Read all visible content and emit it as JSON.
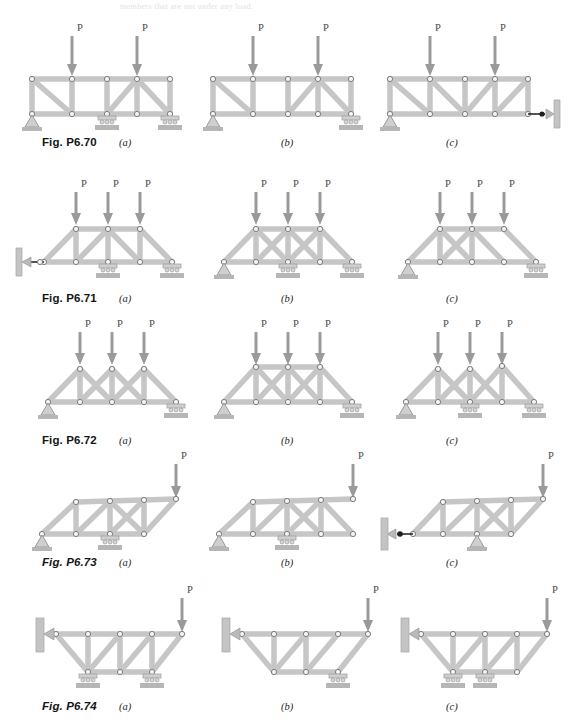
{
  "page": {
    "ghost_text": "members that are not under any load.",
    "load_label": "P",
    "member_color": "#c3c3c3",
    "member_edge": "#8e8e8e",
    "joint_fill": "#f2f2f2",
    "joint_stroke": "#7a7a7a",
    "arrow_color": "#9a9a9a",
    "ground_color": "#b8b8b8",
    "support_color": "#cfcfcf"
  },
  "figures": [
    {
      "id": "p6-70",
      "label": "Fig. P6.70",
      "label_italic": false,
      "label_x": 42,
      "label_y": 136,
      "y": 24,
      "panels": [
        {
          "letter": "(a)",
          "letter_x": 119,
          "letter_y": 136,
          "x": 24,
          "type": "parallel-chord",
          "description": "Parallel chord truss, 4 panels, pin at left, rollers at mid and right",
          "loads": [
            1,
            3
          ],
          "supports": [
            {
              "node": 0,
              "kind": "pin"
            },
            {
              "node": 2,
              "kind": "roller"
            },
            {
              "node": 4,
              "kind": "roller"
            }
          ],
          "diagonals": [
            "d1-down",
            "d3-down",
            "d4-down"
          ],
          "verticals": [
            1,
            2,
            3
          ]
        },
        {
          "letter": "(b)",
          "letter_x": 281,
          "letter_y": 136,
          "x": 205,
          "type": "parallel-chord",
          "description": "Parallel chord truss, 4 panels, pin at left, roller at right",
          "loads": [
            1,
            3
          ],
          "supports": [
            {
              "node": 0,
              "kind": "pin"
            },
            {
              "node": 4,
              "kind": "roller"
            }
          ],
          "diagonals": [
            "d1-down",
            "d3-down",
            "d4-down"
          ],
          "verticals": [
            1,
            2,
            3
          ]
        },
        {
          "letter": "(c)",
          "letter_x": 446,
          "letter_y": 136,
          "x": 382,
          "type": "parallel-chord",
          "description": "Parallel chord truss, pin at left, horizontal link to wall at right",
          "loads": [
            1,
            3
          ],
          "supports": [
            {
              "node": 0,
              "kind": "pin"
            },
            {
              "node": 4,
              "kind": "link-right"
            }
          ],
          "diagonals": [
            "d1-down",
            "d2-down",
            "d3-up",
            "d4-up"
          ],
          "verticals": [
            1,
            2,
            3
          ]
        }
      ]
    },
    {
      "id": "p6-71",
      "label": "Fig. P6.71",
      "label_italic": false,
      "label_x": 42,
      "label_y": 292,
      "y": 186,
      "panels": [
        {
          "letter": "(a)",
          "letter_x": 119,
          "letter_y": 292,
          "x": 18,
          "type": "trapezoid",
          "description": "Trapezoidal truss, wall link at left, rollers under mid and right",
          "loads": [
            1,
            2,
            3
          ],
          "supports": [
            {
              "node": 0,
              "kind": "link-left"
            },
            {
              "node": 2,
              "kind": "roller"
            },
            {
              "node": 4,
              "kind": "roller"
            }
          ],
          "bracing": "single"
        },
        {
          "letter": "(b)",
          "letter_x": 281,
          "letter_y": 292,
          "x": 198,
          "type": "trapezoid",
          "description": "Trapezoidal truss with X-bracing in both middle panels",
          "loads": [
            1,
            2,
            3
          ],
          "supports": [
            {
              "node": 0,
              "kind": "pin"
            },
            {
              "node": 2,
              "kind": "roller"
            },
            {
              "node": 4,
              "kind": "roller"
            }
          ],
          "bracing": "double-x"
        },
        {
          "letter": "(c)",
          "letter_x": 446,
          "letter_y": 292,
          "x": 382,
          "type": "trapezoid",
          "description": "Trapezoidal truss with X-bracing in left middle panel only",
          "loads": [
            1,
            2,
            3
          ],
          "supports": [
            {
              "node": 0,
              "kind": "pin"
            },
            {
              "node": 4,
              "kind": "roller"
            }
          ],
          "bracing": "single-x"
        }
      ]
    },
    {
      "id": "p6-72",
      "label": "Fig. P6.72",
      "label_italic": false,
      "label_x": 42,
      "label_y": 434,
      "y": 326,
      "panels": [
        {
          "letter": "(a)",
          "letter_x": 119,
          "letter_y": 434,
          "x": 24,
          "type": "w-truss",
          "description": "W pattern roof truss with three apexes, pin left, roller right",
          "loads": [
            1,
            2,
            3
          ],
          "supports": [
            {
              "node": 0,
              "kind": "pin"
            },
            {
              "node": 4,
              "kind": "roller"
            }
          ]
        },
        {
          "letter": "(b)",
          "letter_x": 281,
          "letter_y": 434,
          "x": 198,
          "type": "w-truss-flat",
          "description": "Flat-top W truss with X-bracing, pin left, roller right",
          "loads": [
            1,
            2,
            3
          ],
          "supports": [
            {
              "node": 0,
              "kind": "pin"
            },
            {
              "node": 4,
              "kind": "roller"
            }
          ]
        },
        {
          "letter": "(c)",
          "letter_x": 446,
          "letter_y": 434,
          "x": 382,
          "type": "w-truss",
          "description": "W pattern roof truss, pin left, rollers at middle and right",
          "loads": [
            1,
            2,
            3
          ],
          "supports": [
            {
              "node": 0,
              "kind": "pin"
            },
            {
              "node": 2,
              "kind": "roller"
            },
            {
              "node": 4,
              "kind": "roller"
            }
          ]
        }
      ]
    },
    {
      "id": "p6-73",
      "label": "Fig. P6.73",
      "label_italic": true,
      "label_x": 42,
      "label_y": 556,
      "y": 462,
      "panels": [
        {
          "letter": "(a)",
          "letter_x": 119,
          "letter_y": 556,
          "x": 28,
          "type": "cantilever-right",
          "description": "Cantilever truss with sloped ends, load P at right tip, pin left, roller mid",
          "loads": [
            "tip"
          ],
          "supports": [
            {
              "node": 0,
              "kind": "pin"
            },
            {
              "node": 2,
              "kind": "roller"
            }
          ],
          "bracing": "x-middle"
        },
        {
          "letter": "(b)",
          "letter_x": 281,
          "letter_y": 556,
          "x": 205,
          "type": "cantilever-right",
          "description": "Cantilever truss, flat right end, pin left, roller mid",
          "loads": [
            "tip"
          ],
          "supports": [
            {
              "node": 0,
              "kind": "pin"
            },
            {
              "node": 2,
              "kind": "roller"
            }
          ],
          "bracing": "x-middle"
        },
        {
          "letter": "(c)",
          "letter_x": 446,
          "letter_y": 556,
          "x": 375,
          "type": "cantilever-right",
          "description": "Cantilever truss, wall link at left, pin support at middle",
          "loads": [
            "tip"
          ],
          "supports": [
            {
              "node": 0,
              "kind": "link-left"
            },
            {
              "node": 2,
              "kind": "pin"
            }
          ],
          "bracing": "x-middle"
        }
      ]
    },
    {
      "id": "p6-74",
      "label": "Fig. P6.74",
      "label_italic": true,
      "label_x": 42,
      "label_y": 700,
      "y": 596,
      "panels": [
        {
          "letter": "(a)",
          "letter_x": 119,
          "letter_y": 700,
          "x": 22,
          "type": "inverted-trapezoid",
          "description": "Inverted trapezoidal truss fixed to wall at left, load P at right tip, two rollers",
          "loads": [
            "tip"
          ],
          "supports": [
            {
              "node": 1,
              "kind": "roller"
            },
            {
              "node": 3,
              "kind": "roller"
            }
          ]
        },
        {
          "letter": "(b)",
          "letter_x": 281,
          "letter_y": 700,
          "x": 208,
          "type": "inverted-trapezoid",
          "description": "Inverted trapezoidal truss fixed to wall at left, single roller at right bottom",
          "loads": [
            "tip"
          ],
          "supports": [
            {
              "node": 3,
              "kind": "roller"
            }
          ]
        },
        {
          "letter": "(c)",
          "letter_x": 446,
          "letter_y": 700,
          "x": 387,
          "type": "inverted-trapezoid",
          "description": "Inverted trapezoidal truss fixed to wall at left, two rollers under bottom chord",
          "loads": [
            "tip"
          ],
          "supports": [
            {
              "node": 1,
              "kind": "roller"
            },
            {
              "node": 2,
              "kind": "roller"
            }
          ]
        }
      ]
    }
  ]
}
